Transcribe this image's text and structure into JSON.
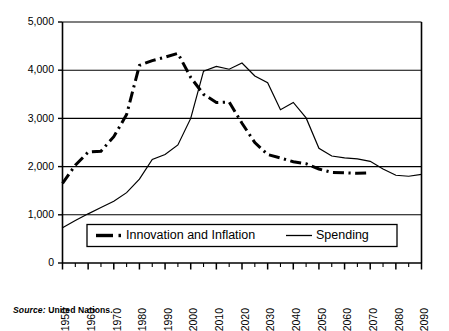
{
  "chart_data": {
    "type": "line",
    "title": "",
    "xlabel": "",
    "ylabel": "",
    "xlim": [
      1950,
      2090
    ],
    "ylim": [
      0,
      5000
    ],
    "grid": true,
    "grid_axis": "y",
    "legend_position": "lower-center-inside",
    "ytick_labels": [
      "0",
      "1,000",
      "2,000",
      "3,000",
      "4,000",
      "5,000"
    ],
    "ytick_values": [
      0,
      1000,
      2000,
      3000,
      4000,
      5000
    ],
    "xtick_labels": [
      "1950",
      "1960",
      "1970",
      "1980",
      "1990",
      "2000",
      "2010",
      "2020",
      "2030",
      "2040",
      "2050",
      "2060",
      "2070",
      "2080",
      "2090"
    ],
    "xtick_values": [
      1950,
      1960,
      1970,
      1980,
      1990,
      2000,
      2010,
      2020,
      2030,
      2040,
      2050,
      2060,
      2070,
      2080,
      2090
    ],
    "minor_tick_step": 5,
    "x": [
      1950,
      1955,
      1960,
      1965,
      1970,
      1975,
      1980,
      1985,
      1990,
      1995,
      2000,
      2005,
      2010,
      2015,
      2020,
      2025,
      2030,
      2035,
      2040,
      2045,
      2050,
      2055,
      2060,
      2065,
      2070,
      2075,
      2080,
      2085,
      2090
    ],
    "series": [
      {
        "name": "Innovation and Inflation",
        "style": "dash-dot",
        "linewidth": 3.0,
        "color": "#000000",
        "values": [
          1650,
          2030,
          2300,
          2320,
          2620,
          3080,
          4100,
          4200,
          4270,
          4350,
          3850,
          3500,
          3330,
          3340,
          2900,
          2500,
          2250,
          2180,
          2100,
          2060,
          1950,
          1880,
          1870,
          1860,
          1870,
          null,
          null,
          null,
          null
        ]
      },
      {
        "name": "Spending",
        "style": "solid",
        "linewidth": 1.2,
        "color": "#000000",
        "values": [
          730,
          880,
          1020,
          1150,
          1280,
          1460,
          1740,
          2150,
          2250,
          2450,
          3000,
          3980,
          4080,
          4020,
          4150,
          3880,
          3740,
          3180,
          3330,
          3010,
          2380,
          2220,
          2180,
          2160,
          2110,
          1950,
          1820,
          1800,
          1840
        ]
      }
    ]
  },
  "legend": {
    "entries": [
      {
        "label": "Innovation and Inflation",
        "marker": "dash-dot-thick"
      },
      {
        "label": "Spending",
        "marker": "solid-thin"
      }
    ]
  },
  "source": {
    "label": "Source:",
    "text": "United Nations."
  },
  "colors": {
    "axis": "#000000",
    "grid": "#000000",
    "series": "#000000",
    "background": "#ffffff"
  }
}
